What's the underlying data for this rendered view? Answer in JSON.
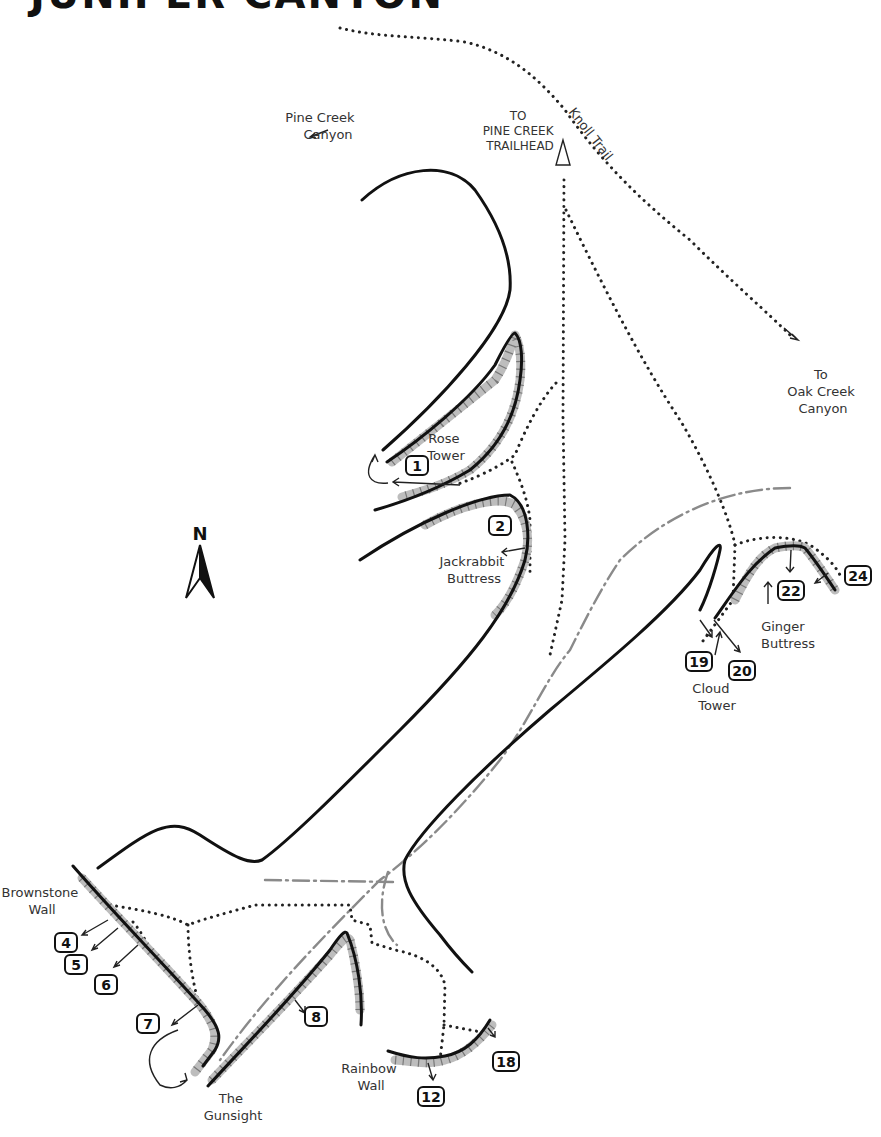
{
  "map": {
    "title": "JUNIPER CANYON",
    "north_label": "N",
    "colors": {
      "wall": "#111111",
      "cliff_shade": "#bdbdbd",
      "trail": "#222222",
      "wash": "#8a8a8a",
      "background": "#ffffff"
    },
    "place_labels": {
      "pine_creek_canyon": [
        "Pine Creek",
        "Canyon"
      ],
      "to_trailhead": [
        "TO",
        "PINE CREEK",
        "TRAILHEAD"
      ],
      "knoll_trail": "Knoll Trail",
      "oak_creek": [
        "To",
        "Oak Creek",
        "Canyon"
      ],
      "rose_tower": [
        "Rose",
        "Tower"
      ],
      "jackrabbit": [
        "Jackrabbit",
        "Buttress"
      ],
      "ginger": [
        "Ginger",
        "Buttress"
      ],
      "cloud_tower": [
        "Cloud",
        "Tower"
      ],
      "brownstone": [
        "Brownstone",
        "Wall"
      ],
      "gunsight": [
        "The",
        "Gunsight"
      ],
      "rainbow": [
        "Rainbow",
        "Wall"
      ]
    },
    "routes": [
      {
        "num": "1",
        "x": 418,
        "y": 466
      },
      {
        "num": "2",
        "x": 500,
        "y": 526
      },
      {
        "num": "4",
        "x": 65,
        "y": 940
      },
      {
        "num": "5",
        "x": 75,
        "y": 964
      },
      {
        "num": "6",
        "x": 105,
        "y": 983
      },
      {
        "num": "7",
        "x": 148,
        "y": 1022
      },
      {
        "num": "8",
        "x": 316,
        "y": 1016
      },
      {
        "num": "12",
        "x": 431,
        "y": 1096
      },
      {
        "num": "18",
        "x": 506,
        "y": 1062
      },
      {
        "num": "19",
        "x": 698,
        "y": 661
      },
      {
        "num": "20",
        "x": 741,
        "y": 670
      },
      {
        "num": "22",
        "x": 790,
        "y": 590
      },
      {
        "num": "24",
        "x": 856,
        "y": 575
      }
    ]
  }
}
